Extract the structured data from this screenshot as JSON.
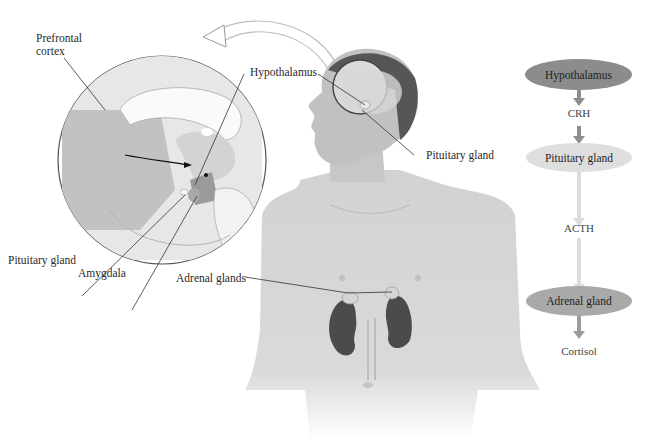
{
  "figure": {
    "illustration": {
      "labels": {
        "prefrontal_cortex": "Prefrontal\ncortex",
        "hypothalamus": "Hypothalamus",
        "pituitary_gland_head": "Pituitary gland",
        "pituitary_gland_inset": "Pituitary gland",
        "amygdala": "Amygdala",
        "adrenal_glands": "Adrenal glands"
      }
    },
    "flowchart": {
      "nodes": [
        {
          "label": "Hypothalamus",
          "color": "#8c8c8c"
        },
        {
          "label": "Pituitary gland",
          "color": "#dedede"
        },
        {
          "label": "Adrenal gland",
          "color": "#a9a9a9"
        }
      ],
      "hormones": [
        "CRH",
        "ACTH",
        "Cortisol"
      ],
      "arrow_colors": {
        "crh": "#8e8e8e",
        "acth": "#dcdcdc",
        "cortisol": "#9c9c9c"
      }
    }
  }
}
